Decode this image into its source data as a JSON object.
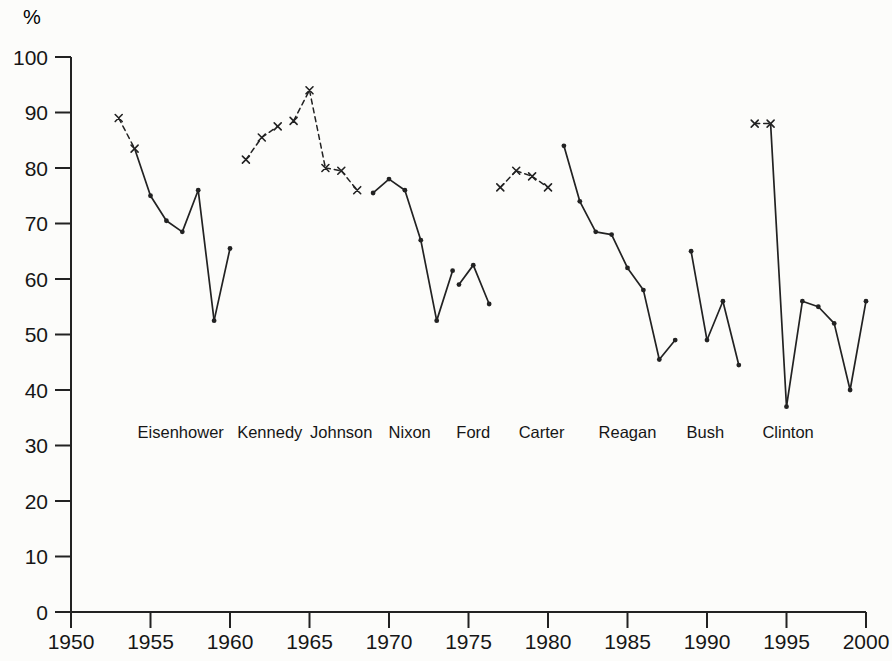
{
  "colors": {
    "background": "#fcfcfa",
    "line": "#222222",
    "text": "#161616"
  },
  "chart_data": {
    "type": "line",
    "title": "",
    "ylabel": "%",
    "xlabel": "",
    "xlim": [
      1950,
      2000
    ],
    "ylim": [
      0,
      100
    ],
    "grid": false,
    "legend_position": "none",
    "x_ticks": [
      1950,
      1955,
      1960,
      1965,
      1970,
      1975,
      1980,
      1985,
      1990,
      1995,
      2000
    ],
    "y_ticks": [
      0,
      10,
      20,
      30,
      40,
      50,
      60,
      70,
      80,
      90,
      100
    ],
    "marker_styles": {
      "x": "cross marker with dashed connecting line",
      "dot": "filled dot marker with solid connecting line"
    },
    "series": [
      {
        "name": "Eisenhower",
        "label_year": 1956.9,
        "points": [
          {
            "year": 1953,
            "value": 89,
            "marker": "x"
          },
          {
            "year": 1954,
            "value": 83.5,
            "marker": "x"
          },
          {
            "year": 1955,
            "value": 75,
            "marker": "dot"
          },
          {
            "year": 1956,
            "value": 70.5,
            "marker": "dot"
          },
          {
            "year": 1957,
            "value": 68.5,
            "marker": "dot"
          },
          {
            "year": 1958,
            "value": 76,
            "marker": "dot"
          },
          {
            "year": 1959,
            "value": 52.5,
            "marker": "dot"
          },
          {
            "year": 1960,
            "value": 65.5,
            "marker": "dot"
          }
        ]
      },
      {
        "name": "Kennedy",
        "label_year": 1962.5,
        "points": [
          {
            "year": 1961,
            "value": 81.5,
            "marker": "x"
          },
          {
            "year": 1962,
            "value": 85.5,
            "marker": "x"
          },
          {
            "year": 1963,
            "value": 87.5,
            "marker": "x"
          }
        ]
      },
      {
        "name": "Johnson",
        "label_year": 1967.0,
        "points": [
          {
            "year": 1964,
            "value": 88.5,
            "marker": "x"
          },
          {
            "year": 1965,
            "value": 94,
            "marker": "x"
          },
          {
            "year": 1966,
            "value": 80,
            "marker": "x"
          },
          {
            "year": 1967,
            "value": 79.5,
            "marker": "x"
          },
          {
            "year": 1968,
            "value": 76,
            "marker": "x"
          }
        ]
      },
      {
        "name": "Nixon",
        "label_year": 1971.3,
        "points": [
          {
            "year": 1969,
            "value": 75.5,
            "marker": "dot"
          },
          {
            "year": 1970,
            "value": 78,
            "marker": "dot"
          },
          {
            "year": 1971,
            "value": 76,
            "marker": "dot"
          },
          {
            "year": 1972,
            "value": 67,
            "marker": "dot"
          },
          {
            "year": 1973,
            "value": 52.5,
            "marker": "dot"
          },
          {
            "year": 1974,
            "value": 61.5,
            "marker": "dot"
          }
        ]
      },
      {
        "name": "Ford",
        "label_year": 1975.3,
        "points": [
          {
            "year": 1974.4,
            "value": 59,
            "marker": "dot"
          },
          {
            "year": 1975.3,
            "value": 62.5,
            "marker": "dot"
          },
          {
            "year": 1976.3,
            "value": 55.5,
            "marker": "dot"
          }
        ]
      },
      {
        "name": "Carter",
        "label_year": 1979.6,
        "points": [
          {
            "year": 1977,
            "value": 76.5,
            "marker": "x"
          },
          {
            "year": 1978,
            "value": 79.5,
            "marker": "x"
          },
          {
            "year": 1979,
            "value": 78.5,
            "marker": "x"
          },
          {
            "year": 1980,
            "value": 76.5,
            "marker": "x"
          }
        ]
      },
      {
        "name": "Reagan",
        "label_year": 1985.0,
        "points": [
          {
            "year": 1981,
            "value": 84,
            "marker": "dot"
          },
          {
            "year": 1982,
            "value": 74,
            "marker": "dot"
          },
          {
            "year": 1983,
            "value": 68.5,
            "marker": "dot"
          },
          {
            "year": 1984,
            "value": 68,
            "marker": "dot"
          },
          {
            "year": 1985,
            "value": 62,
            "marker": "dot"
          },
          {
            "year": 1986,
            "value": 58,
            "marker": "dot"
          },
          {
            "year": 1987,
            "value": 45.5,
            "marker": "dot"
          },
          {
            "year": 1988,
            "value": 49,
            "marker": "dot"
          }
        ]
      },
      {
        "name": "Bush",
        "label_year": 1989.9,
        "points": [
          {
            "year": 1989,
            "value": 65,
            "marker": "dot"
          },
          {
            "year": 1990,
            "value": 49,
            "marker": "dot"
          },
          {
            "year": 1991,
            "value": 56,
            "marker": "dot"
          },
          {
            "year": 1992,
            "value": 44.5,
            "marker": "dot"
          }
        ]
      },
      {
        "name": "Clinton",
        "label_year": 1995.1,
        "points": [
          {
            "year": 1993,
            "value": 88,
            "marker": "x"
          },
          {
            "year": 1994,
            "value": 88,
            "marker": "x"
          },
          {
            "year": 1995,
            "value": 37,
            "marker": "dot"
          },
          {
            "year": 1996,
            "value": 56,
            "marker": "dot"
          },
          {
            "year": 1997,
            "value": 55,
            "marker": "dot"
          },
          {
            "year": 1998,
            "value": 52,
            "marker": "dot"
          },
          {
            "year": 1999,
            "value": 40,
            "marker": "dot"
          },
          {
            "year": 2000,
            "value": 56,
            "marker": "dot"
          }
        ]
      }
    ]
  }
}
